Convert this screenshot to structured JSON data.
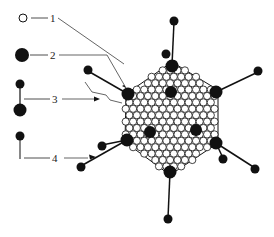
{
  "diagram": {
    "type": "virus-structure",
    "legend": [
      {
        "number": "1",
        "symbol": "open-circle"
      },
      {
        "number": "2",
        "symbol": "large-filled-circle"
      },
      {
        "number": "3",
        "symbol": "fiber-with-two-knobs"
      },
      {
        "number": "4",
        "symbol": "fiber-with-knob"
      }
    ],
    "colors": {
      "ink": "#111111",
      "background": "#ffffff"
    }
  }
}
